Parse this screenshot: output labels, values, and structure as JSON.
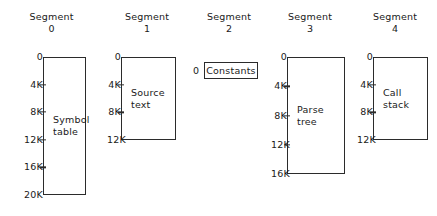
{
  "diagram": {
    "title_text": "Segment",
    "background_color": "#ffffff",
    "line_color": "#2b2b2b",
    "segments": [
      {
        "id": "segment-0",
        "header_word": "Segment",
        "header_number": "0",
        "content_label": "Symbol\ntable",
        "has_box": true,
        "top_tick": "0",
        "bottom_tick": "20K",
        "interior_ticks": [
          "4K",
          "8K",
          "12K",
          "16K"
        ],
        "size_k": 20,
        "column_left": 0,
        "column_width": 103,
        "box_left": 43,
        "box_right": 86,
        "box_top": 57,
        "box_bottom": 195
      },
      {
        "id": "segment-1",
        "header_word": "Segment",
        "header_number": "1",
        "content_label": "Source\ntext",
        "has_box": true,
        "top_tick": "0",
        "bottom_tick": "12K",
        "interior_ticks": [
          "4K",
          "8K"
        ],
        "size_k": 12,
        "column_left": 103,
        "column_width": 88,
        "box_left": 121,
        "box_right": 176,
        "box_top": 57,
        "box_bottom": 140
      },
      {
        "id": "segment-2",
        "header_word": "Segment",
        "header_number": "2",
        "content_label": "Constants",
        "has_box": false,
        "top_tick": "0",
        "bottom_tick": "",
        "interior_ticks": [],
        "size_k": 0,
        "column_left": 191,
        "column_width": 76,
        "box_left": 204,
        "box_right": 258,
        "box_top": 62,
        "box_bottom": 79
      },
      {
        "id": "segment-3",
        "header_word": "Segment",
        "header_number": "3",
        "content_label": "Parse\ntree",
        "has_box": true,
        "top_tick": "0",
        "bottom_tick": "16K",
        "interior_ticks": [
          "4K",
          "8K",
          "12K"
        ],
        "size_k": 16,
        "column_left": 267,
        "column_width": 86,
        "box_left": 287,
        "box_right": 345,
        "box_top": 57,
        "box_bottom": 174
      },
      {
        "id": "segment-4",
        "header_word": "Segment",
        "header_number": "4",
        "content_label": "Call\nstack",
        "has_box": true,
        "top_tick": "0",
        "bottom_tick": "12K",
        "interior_ticks": [
          "4K",
          "8K"
        ],
        "size_k": 12,
        "column_left": 353,
        "column_width": 84,
        "box_left": 373,
        "box_right": 428,
        "box_top": 57,
        "box_bottom": 140
      }
    ]
  }
}
